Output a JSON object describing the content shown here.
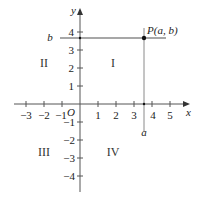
{
  "diagram": {
    "type": "coordinate-plane",
    "axes": {
      "x_label": "x",
      "y_label": "y",
      "origin_label": "O",
      "x_ticks": [
        {
          "label": "−3",
          "x": 26
        },
        {
          "label": "−2",
          "x": 44
        },
        {
          "label": "−1",
          "x": 62
        },
        {
          "label": "1",
          "x": 98
        },
        {
          "label": "2",
          "x": 116
        },
        {
          "label": "3",
          "x": 134
        },
        {
          "label": "4",
          "x": 152
        },
        {
          "label": "5",
          "x": 170
        }
      ],
      "y_ticks": [
        {
          "label": "4",
          "y": 32
        },
        {
          "label": "3",
          "y": 50
        },
        {
          "label": "2",
          "y": 68
        },
        {
          "label": "1",
          "y": 86
        },
        {
          "label": "−1",
          "y": 122
        },
        {
          "label": "−2",
          "y": 140
        },
        {
          "label": "−3",
          "y": 158
        },
        {
          "label": "−4",
          "y": 176
        }
      ]
    },
    "quadrants": [
      {
        "label": "I"
      },
      {
        "label": "II"
      },
      {
        "label": "III"
      },
      {
        "label": "IV"
      }
    ],
    "point": {
      "label": "P(a, b)",
      "x_label": "a",
      "y_label": "b"
    },
    "colors": {
      "axis": "#555555",
      "guide": "#8a8a8a",
      "point": "#111111"
    }
  }
}
